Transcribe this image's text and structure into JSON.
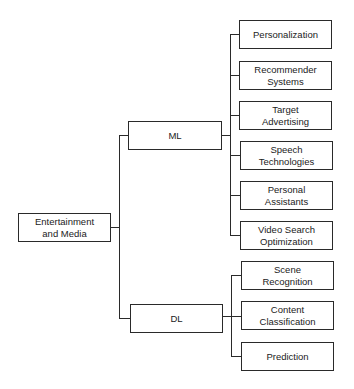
{
  "root": {
    "label": "Entertainment\nand Media"
  },
  "branches": [
    {
      "label": "ML",
      "children": [
        "Personalization",
        "Recommender Systems",
        "Target Advertising",
        "Speech Technologies",
        "Personal Assistants",
        "Video Search Optimization"
      ]
    },
    {
      "label": "DL",
      "children": [
        "Scene Recognition",
        "Content Classification",
        "Prediction"
      ]
    }
  ]
}
